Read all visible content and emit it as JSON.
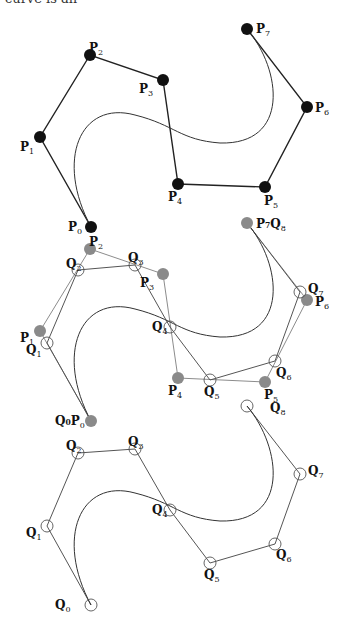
{
  "caption_fragment": "curve is an",
  "colors": {
    "black_point": "#111111",
    "gray_point": "#8a8a8a",
    "p_polygon_top": "#222222",
    "p_polygon_mid": "#8c8c8c",
    "q_polygon": "#555555",
    "curve": "#333333",
    "open_circle": "#555555"
  },
  "panels": [
    {
      "name": "original-control-polygon",
      "description": "Bezier curve of degree 7 with control points P0..P7",
      "curve": "M91,227 C55,160 80,100 135,115 C175,125 180,140 220,143 C290,145 282,70 247,29",
      "polygons": [
        {
          "id": "P",
          "style": "black",
          "points": [
            [
              91,
              227
            ],
            [
              40,
              137
            ],
            [
              90,
              55
            ],
            [
              163,
              80
            ],
            [
              178,
              184
            ],
            [
              265,
              187
            ],
            [
              307,
              107
            ],
            [
              247,
              29
            ]
          ]
        }
      ],
      "points": [
        {
          "label": "P",
          "sub": "0",
          "x": 91,
          "y": 227,
          "kind": "filled-black",
          "lx": 68,
          "ly": 231
        },
        {
          "label": "P",
          "sub": "1",
          "x": 40,
          "y": 137,
          "kind": "filled-black",
          "lx": 20,
          "ly": 151
        },
        {
          "label": "P",
          "sub": "2",
          "x": 90,
          "y": 55,
          "kind": "filled-black",
          "lx": 89,
          "ly": 52
        },
        {
          "label": "P",
          "sub": "3",
          "x": 163,
          "y": 80,
          "kind": "filled-black",
          "lx": 139,
          "ly": 93
        },
        {
          "label": "P",
          "sub": "4",
          "x": 178,
          "y": 184,
          "kind": "filled-black",
          "lx": 168,
          "ly": 201
        },
        {
          "label": "P",
          "sub": "5",
          "x": 265,
          "y": 187,
          "kind": "filled-black",
          "lx": 264,
          "ly": 205
        },
        {
          "label": "P",
          "sub": "6",
          "x": 307,
          "y": 107,
          "kind": "filled-black",
          "lx": 315,
          "ly": 112
        },
        {
          "label": "P",
          "sub": "7",
          "x": 247,
          "y": 29,
          "kind": "filled-black",
          "lx": 256,
          "ly": 33
        }
      ]
    },
    {
      "name": "degree-elevation-overlay",
      "description": "Original control polygon (gray) overlaid with degree-elevated polygon Q0..Q8",
      "curve": "M91,421 C55,354 80,294 135,309 C175,319 180,334 220,337 C290,339 282,264 247,223",
      "polygons": [
        {
          "id": "P",
          "style": "light",
          "points": [
            [
              91,
              421
            ],
            [
              40,
              331
            ],
            [
              90,
              249
            ],
            [
              163,
              274
            ],
            [
              178,
              378
            ],
            [
              265,
              382
            ],
            [
              307,
              300
            ],
            [
              247,
              223
            ]
          ]
        },
        {
          "id": "Q",
          "style": "dark",
          "points": [
            [
              91,
              421
            ],
            [
              47,
              343
            ],
            [
              78,
              270
            ],
            [
              135,
              265
            ],
            [
              170,
              327
            ],
            [
              210,
              380
            ],
            [
              275,
              361
            ],
            [
              300,
              292
            ],
            [
              247,
              223
            ]
          ]
        }
      ],
      "points": [
        {
          "label": "Q₀P",
          "sub": "0",
          "x": 91,
          "y": 421,
          "kind": "filled-gray",
          "lx": 55,
          "ly": 425,
          "composite": true
        },
        {
          "label": "P",
          "sub": "1",
          "x": 40,
          "y": 331,
          "kind": "filled-gray",
          "lx": 20,
          "ly": 342
        },
        {
          "label": "Q",
          "sub": "1",
          "x": 47,
          "y": 343,
          "kind": "open",
          "lx": 26,
          "ly": 354
        },
        {
          "label": "P",
          "sub": "2",
          "x": 90,
          "y": 249,
          "kind": "filled-gray",
          "lx": 89,
          "ly": 246
        },
        {
          "label": "Q",
          "sub": "2",
          "x": 78,
          "y": 270,
          "kind": "open",
          "lx": 66,
          "ly": 268
        },
        {
          "label": "Q",
          "sub": "3",
          "x": 135,
          "y": 265,
          "kind": "open",
          "lx": 128,
          "ly": 262
        },
        {
          "label": "P",
          "sub": "3",
          "x": 163,
          "y": 274,
          "kind": "filled-gray",
          "lx": 140,
          "ly": 287
        },
        {
          "label": "Q",
          "sub": "4",
          "x": 170,
          "y": 327,
          "kind": "open",
          "lx": 152,
          "ly": 331
        },
        {
          "label": "P",
          "sub": "4",
          "x": 178,
          "y": 378,
          "kind": "filled-gray",
          "lx": 168,
          "ly": 395
        },
        {
          "label": "Q",
          "sub": "5",
          "x": 210,
          "y": 380,
          "kind": "open",
          "lx": 204,
          "ly": 396
        },
        {
          "label": "P",
          "sub": "5",
          "x": 265,
          "y": 382,
          "kind": "filled-gray",
          "lx": 264,
          "ly": 399
        },
        {
          "label": "Q",
          "sub": "6",
          "x": 275,
          "y": 361,
          "kind": "open",
          "lx": 276,
          "ly": 377
        },
        {
          "label": "P",
          "sub": "6",
          "x": 307,
          "y": 300,
          "kind": "filled-gray",
          "lx": 315,
          "ly": 306
        },
        {
          "label": "Q",
          "sub": "7",
          "x": 300,
          "y": 292,
          "kind": "open",
          "lx": 308,
          "ly": 293
        },
        {
          "label": "P₇Q",
          "sub": "8",
          "x": 247,
          "y": 223,
          "kind": "filled-gray",
          "lx": 256,
          "ly": 228,
          "composite": true
        },
        {
          "label": "Q",
          "sub": "8",
          "x": 247,
          "y": 406,
          "kind": "open",
          "lx": 270,
          "ly": 412
        }
      ]
    },
    {
      "name": "elevated-control-polygon",
      "description": "Degree-elevated Bezier curve of degree 8 with control points Q0..Q8",
      "curve": "M91,605 C55,538 80,478 135,493 C175,503 180,518 220,521 C290,523 282,448 247,406",
      "polygons": [
        {
          "id": "Q",
          "style": "dark",
          "points": [
            [
              91,
              605
            ],
            [
              47,
              526
            ],
            [
              78,
              453
            ],
            [
              135,
              449
            ],
            [
              170,
              510
            ],
            [
              210,
              563
            ],
            [
              275,
              544
            ],
            [
              300,
              474
            ],
            [
              247,
              406
            ]
          ]
        }
      ],
      "points": [
        {
          "label": "Q",
          "sub": "0",
          "x": 91,
          "y": 605,
          "kind": "open",
          "lx": 55,
          "ly": 609
        },
        {
          "label": "Q",
          "sub": "1",
          "x": 47,
          "y": 526,
          "kind": "open",
          "lx": 26,
          "ly": 537
        },
        {
          "label": "Q",
          "sub": "2",
          "x": 78,
          "y": 453,
          "kind": "open",
          "lx": 66,
          "ly": 450
        },
        {
          "label": "Q",
          "sub": "3",
          "x": 135,
          "y": 449,
          "kind": "open",
          "lx": 128,
          "ly": 446
        },
        {
          "label": "Q",
          "sub": "4",
          "x": 170,
          "y": 510,
          "kind": "open",
          "lx": 152,
          "ly": 514
        },
        {
          "label": "Q",
          "sub": "5",
          "x": 210,
          "y": 563,
          "kind": "open",
          "lx": 204,
          "ly": 579
        },
        {
          "label": "Q",
          "sub": "6",
          "x": 275,
          "y": 544,
          "kind": "open",
          "lx": 276,
          "ly": 559
        },
        {
          "label": "Q",
          "sub": "7",
          "x": 300,
          "y": 474,
          "kind": "open",
          "lx": 308,
          "ly": 475
        }
      ]
    }
  ]
}
